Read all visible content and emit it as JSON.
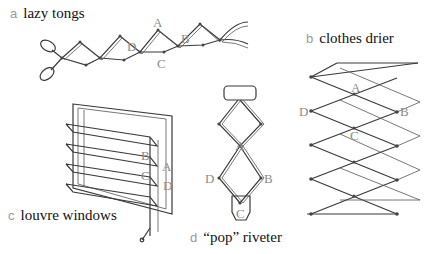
{
  "figure": {
    "panels": [
      {
        "id": "a",
        "letter": "a",
        "title": "lazy tongs",
        "points": [
          "A",
          "B",
          "C",
          "D"
        ]
      },
      {
        "id": "b",
        "letter": "b",
        "title": "clothes drier",
        "points": [
          "A",
          "B",
          "C",
          "D"
        ]
      },
      {
        "id": "c",
        "letter": "c",
        "title": "louvre windows",
        "points": [
          "A",
          "B",
          "C",
          "D"
        ]
      },
      {
        "id": "d",
        "letter": "d",
        "title": "“pop” riveter",
        "points": [
          "A",
          "B",
          "C",
          "D"
        ]
      }
    ]
  },
  "colors": {
    "line": "#3a3a3a",
    "label_gray": "#8c8c8c",
    "letter_gray": "#9a9a9a"
  }
}
